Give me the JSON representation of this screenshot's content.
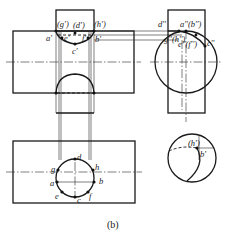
{
  "figure": {
    "caption": "(b)",
    "views": {
      "front": {
        "labels": {
          "g": "(g')",
          "d": "(d')",
          "h": "(h')",
          "a": "a'",
          "b": "b'",
          "e": "e'",
          "f": "f'",
          "c": "c'"
        }
      },
      "side": {
        "labels": {
          "d": "d''",
          "ab": "a''(b'')",
          "gh": "g''(h'')",
          "ef": "e''(f'')",
          "c": "c''"
        }
      },
      "top": {
        "labels": {
          "d": "d",
          "g": "g",
          "h": "h",
          "a": "a",
          "b": "b",
          "e": "e",
          "f": "f",
          "c": "c"
        }
      },
      "detail": {
        "labels": {
          "h": "(h')",
          "b": "b'"
        }
      }
    }
  }
}
